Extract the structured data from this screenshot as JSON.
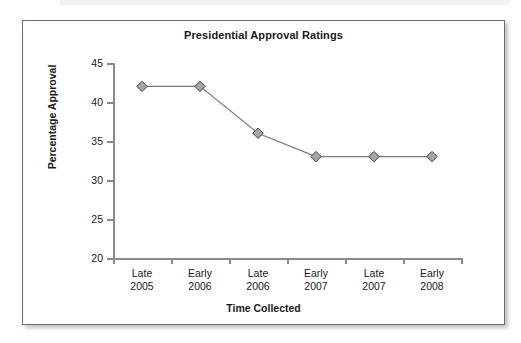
{
  "chart_data": {
    "type": "line",
    "title": "Presidential Approval Ratings",
    "xlabel": "Time Collected",
    "ylabel": "Percentage Approval",
    "categories": [
      "Late\n2005",
      "Early\n2006",
      "Late\n2006",
      "Early\n2007",
      "Late\n2007",
      "Early\n2008"
    ],
    "category_lines": [
      [
        "Late",
        "2005"
      ],
      [
        "Early",
        "2006"
      ],
      [
        "Late",
        "2006"
      ],
      [
        "Early",
        "2007"
      ],
      [
        "Late",
        "2007"
      ],
      [
        "Early",
        "2008"
      ]
    ],
    "values": [
      42,
      42,
      36,
      33,
      33,
      33
    ],
    "ylim": [
      20,
      45
    ],
    "yticks": [
      20,
      25,
      30,
      35,
      40,
      45
    ],
    "ytick_labels": [
      "20",
      "25",
      "30",
      "35",
      "40",
      "45"
    ],
    "grid": false,
    "legend": false,
    "marker": "diamond",
    "marker_fill": "#a6a6a6",
    "marker_stroke": "#3f3f3f",
    "line_color": "#7a7a7a",
    "axis_color": "#8a8a8a",
    "text_color": "#1a1a1a",
    "plot_background": "#ffffff"
  },
  "figure": {
    "border_color": "#6e6e6e",
    "background": "#ffffff"
  },
  "labels": {
    "y0": "20",
    "y1": "25",
    "y2": "30",
    "y3": "35",
    "y4": "40",
    "y5": "45",
    "x0a": "Late",
    "x0b": "2005",
    "x1a": "Early",
    "x1b": "2006",
    "x2a": "Late",
    "x2b": "2006",
    "x3a": "Early",
    "x3b": "2007",
    "x4a": "Late",
    "x4b": "2007",
    "x5a": "Early",
    "x5b": "2008"
  }
}
